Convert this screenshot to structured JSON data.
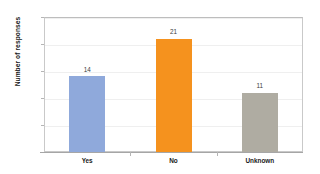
{
  "chart_data": {
    "type": "bar",
    "title": "",
    "xlabel": "",
    "ylabel": "Number of responses",
    "categories": [
      "Yes",
      "No",
      "Unknown"
    ],
    "values": [
      14,
      21,
      11
    ],
    "bar_colors": [
      "#8FA9DB",
      "#F5921E",
      "#AFACA2"
    ],
    "ylim": [
      0,
      25
    ],
    "yticks": [
      0,
      5,
      10,
      15,
      20,
      25
    ],
    "ytick_labels": [
      "0",
      "5",
      "10",
      "15",
      "20",
      "25"
    ],
    "data_labels": [
      "14",
      "21",
      "11"
    ],
    "grid": true,
    "grid_axis": "y",
    "legend": false,
    "legend_position": "none",
    "plot_border": true,
    "background": "#FFFFFF"
  }
}
